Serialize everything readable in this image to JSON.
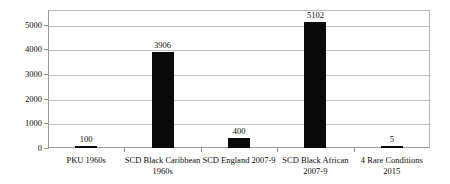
{
  "chart_data": {
    "type": "bar",
    "title": "",
    "subtitle": "",
    "xlabel": "",
    "ylabel": "",
    "categories": [
      "PKU 1960s",
      "SCD Black Caribbean 1960s",
      "SCD England 2007-9",
      "SCD Black African 2007-9",
      "4 Rare Conditions 2015"
    ],
    "category_lines": [
      [
        "PKU 1960s",
        ""
      ],
      [
        "SCD Black Caribbean",
        "1960s"
      ],
      [
        "SCD England 2007-9",
        ""
      ],
      [
        "SCD Black African",
        "2007-9"
      ],
      [
        "4 Rare Conditions",
        "2015"
      ]
    ],
    "values": [
      100,
      3906,
      400,
      5102,
      5
    ],
    "value_labels": [
      "100",
      "3906",
      "400",
      "5102",
      "5"
    ],
    "ylim": [
      0,
      5600
    ],
    "yticks": [
      0,
      1000,
      2000,
      3000,
      4000,
      5000
    ],
    "ytick_labels": [
      "0",
      "1000",
      "2000",
      "3000",
      "4000",
      "5000"
    ],
    "grid": true,
    "legend": false,
    "legend_position": "none",
    "bar_color": "#0a0a0a",
    "gridline_color": "#bcbcbc",
    "axis_color": "#9a9a9a",
    "background_color": "#ffffff",
    "text_color": "#0d0d0d"
  }
}
